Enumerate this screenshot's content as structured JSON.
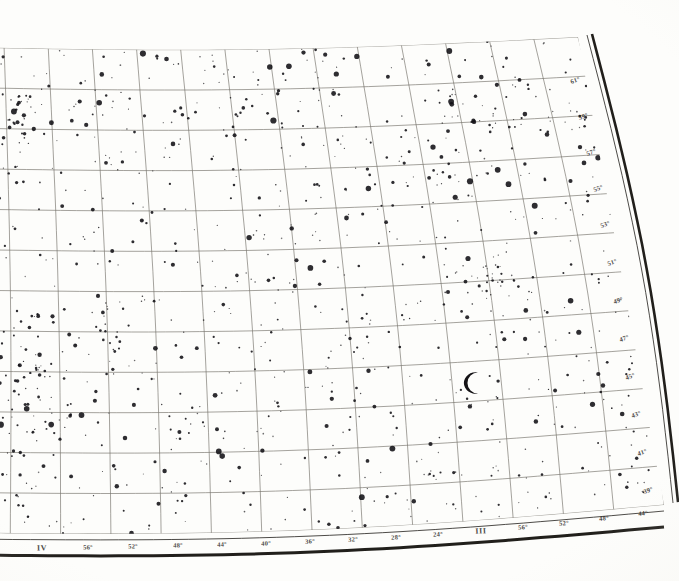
{
  "plate": {
    "kind": "antique-photographic-star-chart",
    "description": "Scanned antique star atlas plate: curved equatorial coordinate grid over a dense photographic star field",
    "background_color": "#fdfdfb",
    "ink_color": "#1d1b18",
    "grid_color": "#6e6a63",
    "border_color": "#15130f",
    "star_color": "#111014"
  },
  "symbols": {
    "moon": {
      "name": "crescent-moon-scale-symbol",
      "glyph": "crescent",
      "x": 478,
      "y": 383,
      "radius": 17
    }
  },
  "axes": {
    "bottom": {
      "name": "right-ascension-axis",
      "labels": [
        {
          "text": "IV",
          "x": 42,
          "y": 548,
          "type": "roman",
          "rot": -1.0
        },
        {
          "text": "56°",
          "x": 88,
          "y": 547,
          "type": "deg",
          "rot": -1.0
        },
        {
          "text": "52°",
          "x": 133,
          "y": 546,
          "type": "deg",
          "rot": -1.2
        },
        {
          "text": "48°",
          "x": 178,
          "y": 545,
          "type": "deg",
          "rot": -1.4
        },
        {
          "text": "44°",
          "x": 222,
          "y": 544,
          "type": "deg",
          "rot": -1.6
        },
        {
          "text": "40°",
          "x": 266,
          "y": 543,
          "type": "deg",
          "rot": -1.8
        },
        {
          "text": "36°",
          "x": 310,
          "y": 541,
          "type": "deg",
          "rot": -2.0
        },
        {
          "text": "32°",
          "x": 353,
          "y": 539,
          "type": "deg",
          "rot": -2.3
        },
        {
          "text": "28°",
          "x": 396,
          "y": 537,
          "type": "deg",
          "rot": -2.6
        },
        {
          "text": "24°",
          "x": 438,
          "y": 534,
          "type": "deg",
          "rot": -3.0
        },
        {
          "text": "III",
          "x": 481,
          "y": 531,
          "type": "roman",
          "rot": -3.4
        },
        {
          "text": "56°",
          "x": 523,
          "y": 527,
          "type": "deg",
          "rot": -3.8
        },
        {
          "text": "52°",
          "x": 564,
          "y": 523,
          "type": "deg",
          "rot": -4.2
        },
        {
          "text": "48°",
          "x": 604,
          "y": 518,
          "type": "deg",
          "rot": -4.6
        },
        {
          "text": "44°",
          "x": 643,
          "y": 513,
          "type": "deg",
          "rot": -5.0
        }
      ]
    },
    "right": {
      "name": "declination-axis",
      "labels": [
        {
          "text": "61°",
          "x": 575,
          "y": 80,
          "type": "dec",
          "rot": -18
        },
        {
          "text": "59°",
          "x": 583,
          "y": 116,
          "type": "dec",
          "rot": -18
        },
        {
          "text": "57°",
          "x": 591,
          "y": 152,
          "type": "dec",
          "rot": -18
        },
        {
          "text": "55°",
          "x": 598,
          "y": 188,
          "type": "dec",
          "rot": -18
        },
        {
          "text": "53°",
          "x": 605,
          "y": 224,
          "type": "dec",
          "rot": -18
        },
        {
          "text": "51°",
          "x": 612,
          "y": 262,
          "type": "dec",
          "rot": -18
        },
        {
          "text": "49°",
          "x": 618,
          "y": 300,
          "type": "dec",
          "rot": -18
        },
        {
          "text": "47°",
          "x": 624,
          "y": 338,
          "type": "dec",
          "rot": -18
        },
        {
          "text": "45°",
          "x": 630,
          "y": 376,
          "type": "dec",
          "rot": -18
        },
        {
          "text": "43°",
          "x": 636,
          "y": 414,
          "type": "dec",
          "rot": -18
        },
        {
          "text": "41°",
          "x": 642,
          "y": 452,
          "type": "dec",
          "rot": -18
        },
        {
          "text": "39°",
          "x": 648,
          "y": 490,
          "type": "dec",
          "rot": -18
        }
      ]
    }
  },
  "chart_data": {
    "type": "scatter",
    "title": "",
    "xlabel": "Right Ascension",
    "ylabel": "Declination",
    "grid": true,
    "legend": "none",
    "projection": "curved-conic-grid",
    "xlim": [
      44,
      64
    ],
    "ylim": [
      38,
      62
    ],
    "grid_meridians": 14,
    "grid_parallels": 12,
    "star_count": 1100,
    "magnitude_classes": [
      {
        "name": "bright",
        "radius": 2.6,
        "fraction": 0.05
      },
      {
        "name": "medium",
        "radius": 1.8,
        "fraction": 0.13
      },
      {
        "name": "faint",
        "radius": 1.15,
        "fraction": 0.32
      },
      {
        "name": "very-faint",
        "radius": 0.7,
        "fraction": 0.5
      }
    ]
  }
}
